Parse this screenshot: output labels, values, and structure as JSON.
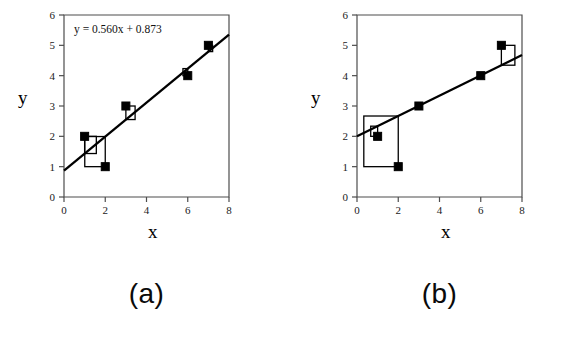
{
  "figure": {
    "background": "#ffffff",
    "line_color": "#000000",
    "marker_color": "#000000",
    "residual_box_color": "#000000"
  },
  "panels": [
    {
      "id": "a",
      "caption": "(a)",
      "equation": "y = 0.560x + 0.873",
      "axis": {
        "xlabel": "x",
        "ylabel": "y",
        "xlim": [
          0,
          8
        ],
        "ylim": [
          0,
          6
        ],
        "xticks": [
          0,
          2,
          4,
          6,
          8
        ],
        "xtick_labels": [
          "0",
          "2",
          "4",
          "6",
          "8"
        ],
        "yticks": [
          0,
          1,
          2,
          3,
          4,
          5,
          6
        ],
        "ytick_labels": [
          "0",
          "1",
          "2",
          "3",
          "4",
          "5",
          "6"
        ],
        "grid": false
      },
      "chart_data": {
        "type": "scatter",
        "title": "",
        "xlabel": "x",
        "ylabel": "y",
        "xlim": [
          0,
          8
        ],
        "ylim": [
          0,
          6
        ],
        "x": [
          1,
          2,
          3,
          6,
          7
        ],
        "y": [
          2,
          1,
          3,
          4,
          5
        ],
        "fit_line": {
          "label": "y = 0.560x + 0.873",
          "slope": 0.56,
          "intercept": 0.873,
          "x_start": 0,
          "x_end": 8
        },
        "residual_squares": [
          {
            "x": 1,
            "y": 2,
            "fitted": 1.433,
            "residual": 0.567
          },
          {
            "x": 2,
            "y": 1,
            "fitted": 1.993,
            "residual": -0.993
          },
          {
            "x": 3,
            "y": 3,
            "fitted": 2.553,
            "residual": 0.447
          },
          {
            "x": 6,
            "y": 4,
            "fitted": 4.233,
            "residual": -0.233
          },
          {
            "x": 7,
            "y": 5,
            "fitted": 4.793,
            "residual": 0.207
          }
        ]
      }
    },
    {
      "id": "b",
      "caption": "(b)",
      "equation": "",
      "axis": {
        "xlabel": "x",
        "ylabel": "y",
        "xlim": [
          0,
          8
        ],
        "ylim": [
          0,
          6
        ],
        "xticks": [
          0,
          2,
          4,
          6,
          8
        ],
        "xtick_labels": [
          "0",
          "2",
          "4",
          "6",
          "8"
        ],
        "yticks": [
          0,
          1,
          2,
          3,
          4,
          5,
          6
        ],
        "ytick_labels": [
          "0",
          "1",
          "2",
          "3",
          "4",
          "5",
          "6"
        ],
        "grid": false
      },
      "chart_data": {
        "type": "scatter",
        "title": "",
        "xlabel": "x",
        "ylabel": "y",
        "xlim": [
          0,
          8
        ],
        "ylim": [
          0,
          6
        ],
        "x": [
          1,
          2,
          3,
          6,
          7
        ],
        "y": [
          2,
          1,
          3,
          4,
          5
        ],
        "fit_line": {
          "label": "",
          "slope": 0.335,
          "intercept": 2.0,
          "x_start": 0,
          "x_end": 8
        },
        "residual_squares": [
          {
            "x": 1,
            "y": 2,
            "fitted": 2.335,
            "residual": -0.335
          },
          {
            "x": 2,
            "y": 1,
            "fitted": 2.67,
            "residual": -1.67
          },
          {
            "x": 3,
            "y": 3,
            "fitted": 3.005,
            "residual": -0.005
          },
          {
            "x": 6,
            "y": 4,
            "fitted": 4.01,
            "residual": -0.01
          },
          {
            "x": 7,
            "y": 5,
            "fitted": 4.345,
            "residual": 0.655
          }
        ]
      }
    }
  ]
}
